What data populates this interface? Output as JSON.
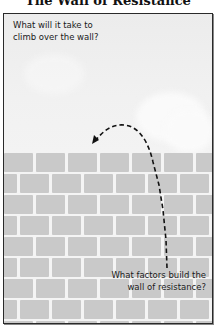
{
  "title": "The Wall of Resistance",
  "questions": {
    "top": "What will it take to climb over the wall?",
    "top_lines": [
      "What will it take to",
      "climb over the wall?"
    ],
    "bottom": "What factors build the wall of resistance?",
    "bottom_lines": [
      "What factors build the",
      "wall of resistance?"
    ]
  },
  "illustration": {
    "sky_color": "#efefef",
    "brick_color": "#c9c9c9",
    "mortar_color": "#f4f4f4",
    "frame_color": "#2a2a2a",
    "arrow": "dashed-curved-arrow",
    "arrow_color": "#111111",
    "brick_rows": 9
  }
}
